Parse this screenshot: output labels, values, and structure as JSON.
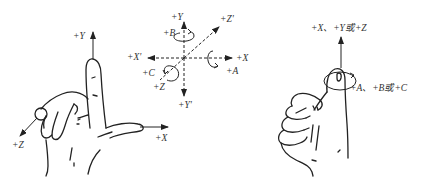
{
  "diagram": {
    "type": "coordinate-system-right-hand-rule",
    "colors": {
      "ink": "#222222",
      "label": "#333333",
      "background": "#ffffff"
    },
    "left_hand": {
      "labels": {
        "y": "+Y",
        "z": "+Z",
        "x": "+X"
      }
    },
    "axes_cross": {
      "labels": {
        "y": "+Y",
        "b": "+B",
        "z_prime": "+Z'",
        "x_prime": "+X'",
        "x": "+X",
        "c": "+C",
        "a": "+A",
        "z": "+Z",
        "y_prime": "+Y'"
      }
    },
    "right_hand": {
      "labels": {
        "linear": "+X、+Y或+Z",
        "rotary": "+A、+B或+C"
      }
    }
  }
}
